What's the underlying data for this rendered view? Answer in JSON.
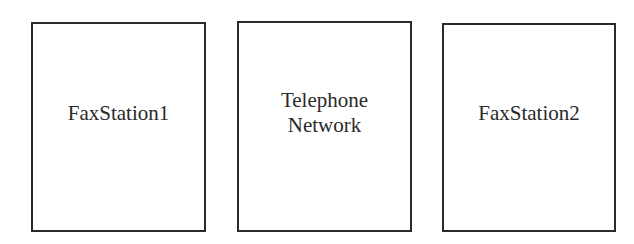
{
  "diagram": {
    "boxes": [
      {
        "label": "FaxStation1"
      },
      {
        "label_lines": [
          "Telephone",
          "Network"
        ]
      },
      {
        "label": "FaxStation2"
      }
    ],
    "colors": {
      "stroke": "#2a2a2a",
      "background": "#ffffff",
      "text": "#2a2a2a"
    }
  }
}
